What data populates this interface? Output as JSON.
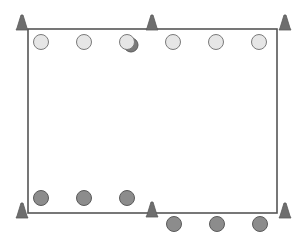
{
  "diagram": {
    "type": "drill-field",
    "width": 307,
    "height": 243,
    "colors": {
      "background": "#ffffff",
      "boundary_line": "#555555",
      "cone_fill": "#6e6e6e",
      "cone_stroke": "#5a5a5a",
      "light_player_fill": "#e6e6e6",
      "light_player_stroke": "#7a7a7a",
      "dark_player_fill": "#8c8c8c",
      "dark_player_stroke": "#5a5a5a",
      "ball_shadow_fill": "#7a7a7a"
    },
    "boundary": {
      "x1": 28,
      "y1": 29,
      "x2": 277,
      "y2": 213
    },
    "cones": [
      {
        "id": "cone-top-left",
        "x": 22,
        "y": 29
      },
      {
        "id": "cone-top-center",
        "x": 152,
        "y": 29
      },
      {
        "id": "cone-top-right",
        "x": 285,
        "y": 29
      },
      {
        "id": "cone-bottom-left",
        "x": 22,
        "y": 217
      },
      {
        "id": "cone-bottom-center",
        "x": 152,
        "y": 216
      },
      {
        "id": "cone-bottom-right",
        "x": 285,
        "y": 217
      }
    ],
    "light_players": [
      {
        "id": "light-player-1",
        "x": 41,
        "y": 42
      },
      {
        "id": "light-player-2",
        "x": 84,
        "y": 42
      },
      {
        "id": "light-player-3",
        "x": 127,
        "y": 42,
        "has_ball": true
      },
      {
        "id": "light-player-4",
        "x": 173,
        "y": 42
      },
      {
        "id": "light-player-5",
        "x": 216,
        "y": 42
      },
      {
        "id": "light-player-6",
        "x": 259,
        "y": 42
      }
    ],
    "dark_players": [
      {
        "id": "dark-player-1",
        "x": 41,
        "y": 198
      },
      {
        "id": "dark-player-2",
        "x": 84,
        "y": 198
      },
      {
        "id": "dark-player-3",
        "x": 127,
        "y": 198
      },
      {
        "id": "dark-player-4",
        "x": 174,
        "y": 224
      },
      {
        "id": "dark-player-5",
        "x": 217,
        "y": 224
      },
      {
        "id": "dark-player-6",
        "x": 260,
        "y": 224
      }
    ],
    "player_radius": 7.5
  }
}
